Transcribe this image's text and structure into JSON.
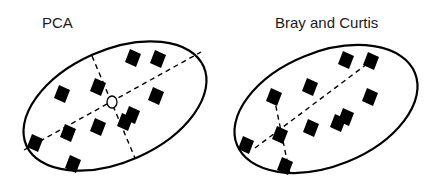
{
  "panels": [
    {
      "title": "PCA",
      "title_pos": [
        42,
        28
      ],
      "ellipse": {
        "cx": 115,
        "cy": 106,
        "rx": 97,
        "ry": 56,
        "rotate": -24
      },
      "centroid_circle": {
        "cx": 112,
        "cy": 102,
        "r": 6
      },
      "dashed_lines": [
        {
          "x1": 24,
          "y1": 150,
          "x2": 201,
          "y2": 52
        },
        {
          "x1": 92,
          "y1": 56,
          "x2": 135,
          "y2": 158
        }
      ],
      "points": [
        [
          133,
          58
        ],
        [
          158,
          59
        ],
        [
          62,
          94
        ],
        [
          98,
          87
        ],
        [
          156,
          96
        ],
        [
          132,
          115
        ],
        [
          125,
          122
        ],
        [
          98,
          127
        ],
        [
          68,
          133
        ],
        [
          35,
          143
        ],
        [
          73,
          164
        ]
      ]
    },
    {
      "title": "Bray and Curtis",
      "title_pos": [
        275,
        28
      ],
      "ellipse": {
        "cx": 326,
        "cy": 109,
        "rx": 96,
        "ry": 57,
        "rotate": -22
      },
      "dashed_lines": [
        {
          "x1": 255,
          "y1": 148,
          "x2": 371,
          "y2": 61
        },
        {
          "x1": 274,
          "y1": 97,
          "x2": 290,
          "y2": 175
        }
      ],
      "points": [
        [
          346,
          60
        ],
        [
          371,
          61
        ],
        [
          310,
          87
        ],
        [
          274,
          97
        ],
        [
          370,
          97
        ],
        [
          346,
          117
        ],
        [
          338,
          123
        ],
        [
          311,
          128
        ],
        [
          280,
          135
        ],
        [
          246,
          145
        ],
        [
          285,
          166
        ]
      ]
    }
  ],
  "style": {
    "stroke": "#000000",
    "point_fill": "#000000",
    "background": "#ffffff"
  }
}
